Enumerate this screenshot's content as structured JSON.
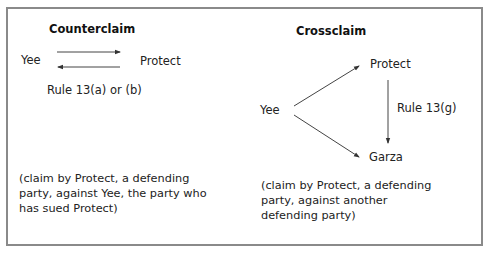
{
  "counterclaim": {
    "title": "Counterclaim",
    "left_party": "Yee",
    "right_party": "Protect",
    "rule": "Rule 13(a) or (b)",
    "caption_lines": [
      "(claim by Protect, a defending",
      "party, against Yee, the party who",
      "has sued Protect)"
    ]
  },
  "crossclaim": {
    "title": "Crossclaim",
    "plaintiff": "Yee",
    "top_party": "Protect",
    "bottom_party": "Garza",
    "rule": "Rule 13(g)",
    "caption_lines": [
      "(claim by Protect, a defending",
      "party, against another",
      "defending party)"
    ]
  },
  "colors": {
    "border": "#8a8a8a",
    "arrow": "#333333",
    "text": "#222222"
  }
}
